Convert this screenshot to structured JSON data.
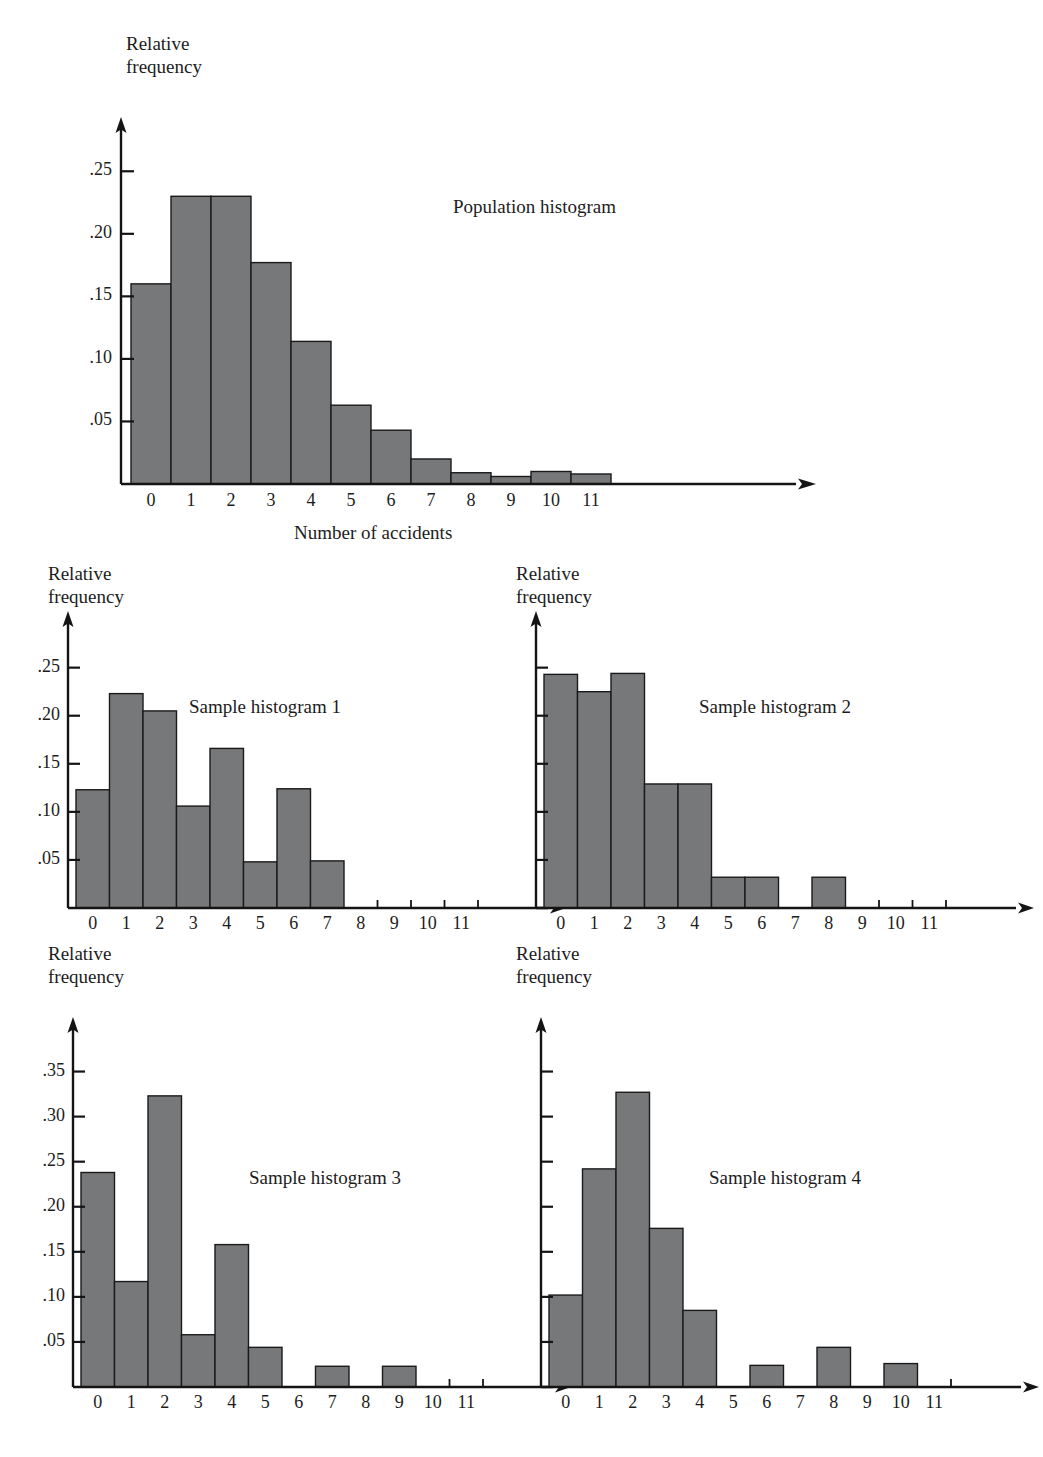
{
  "figure": {
    "y_axis_label": "Relative\nfrequency",
    "x_axis_label": "Number of accidents",
    "bar_fill": "#77787a",
    "bar_stroke": "#1a1a1a",
    "axis_color": "#141414"
  },
  "charts": [
    {
      "id": "population-histogram",
      "caption": "Population histogram",
      "y_axis_label": "Relative\nfrequency",
      "x_axis_label": "Number of accidents",
      "chart_data": {
        "type": "bar",
        "title": "Population histogram",
        "xlabel": "Number of accidents",
        "ylabel": "Relative frequency",
        "categories": [
          "0",
          "1",
          "2",
          "3",
          "4",
          "5",
          "6",
          "7",
          "8",
          "9",
          "10",
          "11"
        ],
        "values": [
          0.16,
          0.23,
          0.23,
          0.177,
          0.114,
          0.063,
          0.043,
          0.02,
          0.009,
          0.006,
          0.01,
          0.008
        ],
        "ylim": [
          0,
          0.275
        ],
        "yticks": [
          0.05,
          0.1,
          0.15,
          0.2,
          0.25
        ],
        "ytick_labels": [
          ".05",
          ".10",
          ".15",
          ".20",
          ".25"
        ],
        "grid": false,
        "legend": "none"
      }
    },
    {
      "id": "sample-histogram-1",
      "caption": "Sample histogram 1",
      "y_axis_label": "Relative\nfrequency",
      "x_axis_label": "",
      "chart_data": {
        "type": "bar",
        "title": "Sample histogram 1",
        "xlabel": "",
        "ylabel": "Relative frequency",
        "categories": [
          "0",
          "1",
          "2",
          "3",
          "4",
          "5",
          "6",
          "7",
          "8",
          "9",
          "10",
          "11"
        ],
        "values": [
          0.123,
          0.223,
          0.205,
          0.106,
          0.166,
          0.048,
          0.124,
          0.049,
          0,
          0,
          0,
          0
        ],
        "ylim": [
          0,
          0.285
        ],
        "yticks": [
          0.05,
          0.1,
          0.15,
          0.2,
          0.25
        ],
        "ytick_labels": [
          ".05",
          ".10",
          ".15",
          ".20",
          ".25"
        ],
        "grid": false,
        "legend": "none"
      }
    },
    {
      "id": "sample-histogram-2",
      "caption": "Sample histogram 2",
      "y_axis_label": "Relative\nfrequency",
      "x_axis_label": "",
      "chart_data": {
        "type": "bar",
        "title": "Sample histogram 2",
        "xlabel": "",
        "ylabel": "Relative frequency",
        "categories": [
          "0",
          "1",
          "2",
          "3",
          "4",
          "5",
          "6",
          "7",
          "8",
          "9",
          "10",
          "11"
        ],
        "values": [
          0.243,
          0.225,
          0.244,
          0.129,
          0.129,
          0.032,
          0.032,
          0,
          0.032,
          0,
          0,
          0
        ],
        "ylim": [
          0,
          0.285
        ],
        "yticks": [
          0.05,
          0.1,
          0.15,
          0.2,
          0.25
        ],
        "ytick_labels": [
          "",
          "",
          "",
          "",
          ""
        ],
        "grid": false,
        "legend": "none"
      }
    },
    {
      "id": "sample-histogram-3",
      "caption": "Sample histogram 3",
      "y_axis_label": "Relative\nfrequency",
      "x_axis_label": "",
      "chart_data": {
        "type": "bar",
        "title": "Sample histogram 3",
        "xlabel": "",
        "ylabel": "Relative frequency",
        "categories": [
          "0",
          "1",
          "2",
          "3",
          "4",
          "5",
          "6",
          "7",
          "8",
          "9",
          "10",
          "11"
        ],
        "values": [
          0.238,
          0.117,
          0.323,
          0.058,
          0.158,
          0.044,
          0,
          0.023,
          0,
          0.023,
          0,
          0
        ],
        "ylim": [
          0,
          0.385
        ],
        "yticks": [
          0.05,
          0.1,
          0.15,
          0.2,
          0.25,
          0.3,
          0.35
        ],
        "ytick_labels": [
          ".05",
          ".10",
          ".15",
          ".20",
          ".25",
          ".30",
          ".35"
        ],
        "grid": false,
        "legend": "none"
      }
    },
    {
      "id": "sample-histogram-4",
      "caption": "Sample histogram 4",
      "y_axis_label": "Relative\nfrequency",
      "x_axis_label": "",
      "chart_data": {
        "type": "bar",
        "title": "Sample histogram 4",
        "xlabel": "",
        "ylabel": "Relative frequency",
        "categories": [
          "0",
          "1",
          "2",
          "3",
          "4",
          "5",
          "6",
          "7",
          "8",
          "9",
          "10",
          "11"
        ],
        "values": [
          0.102,
          0.242,
          0.327,
          0.176,
          0.085,
          0,
          0.024,
          0,
          0.044,
          0,
          0.026,
          0
        ],
        "ylim": [
          0,
          0.385
        ],
        "yticks": [
          0.05,
          0.1,
          0.15,
          0.2,
          0.25,
          0.3,
          0.35
        ],
        "ytick_labels": [
          "",
          "",
          "",
          "",
          "",
          "",
          ""
        ],
        "grid": false,
        "legend": "none"
      }
    }
  ]
}
